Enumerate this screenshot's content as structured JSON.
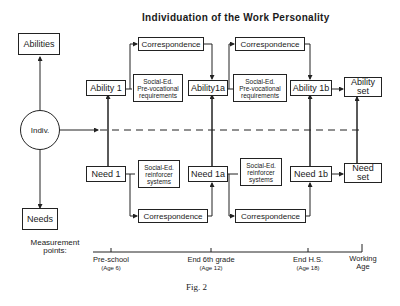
{
  "title": "Individuation of the Work Personality",
  "nodes": {
    "abilities": "Abilities",
    "needs": "Needs",
    "indiv": "Indiv.",
    "ability1": "Ability 1",
    "ability1a": "Ability1a",
    "ability1b": "Ability 1b",
    "ability_set_l1": "Ability",
    "ability_set_l2": "set",
    "need1": "Need 1",
    "need1a": "Need 1a",
    "need1b": "Need 1b",
    "need_set_l1": "Need",
    "need_set_l2": "set",
    "corr_top_1": "Correspondence",
    "corr_top_2": "Correspondence",
    "corr_bot_1": "Correspondence",
    "corr_bot_2": "Correspondence",
    "req1_l1": "Social-Ed.",
    "req1_l2": "Pre-vocational",
    "req1_l3": "requirements",
    "req2_l1": "Social-Ed.",
    "req2_l2": "Pre-vocational",
    "req2_l3": "requirements",
    "reinf1_l1": "Social-Ed.",
    "reinf1_l2": "reinforcer",
    "reinf1_l3": "systems",
    "reinf2_l1": "Social-Ed.",
    "reinf2_l2": "reinforcer",
    "reinf2_l3": "systems"
  },
  "timeline": {
    "label_l1": "Measurement",
    "label_l2": "points:",
    "points": [
      {
        "name": "Pre-school",
        "age": "(Age 6)"
      },
      {
        "name": "End 6th grade",
        "age": "(Age 12)"
      },
      {
        "name": "End H.S.",
        "age": "(Age 18)"
      },
      {
        "name": "Working",
        "age": "Age"
      }
    ]
  },
  "caption": "Fig. 2"
}
